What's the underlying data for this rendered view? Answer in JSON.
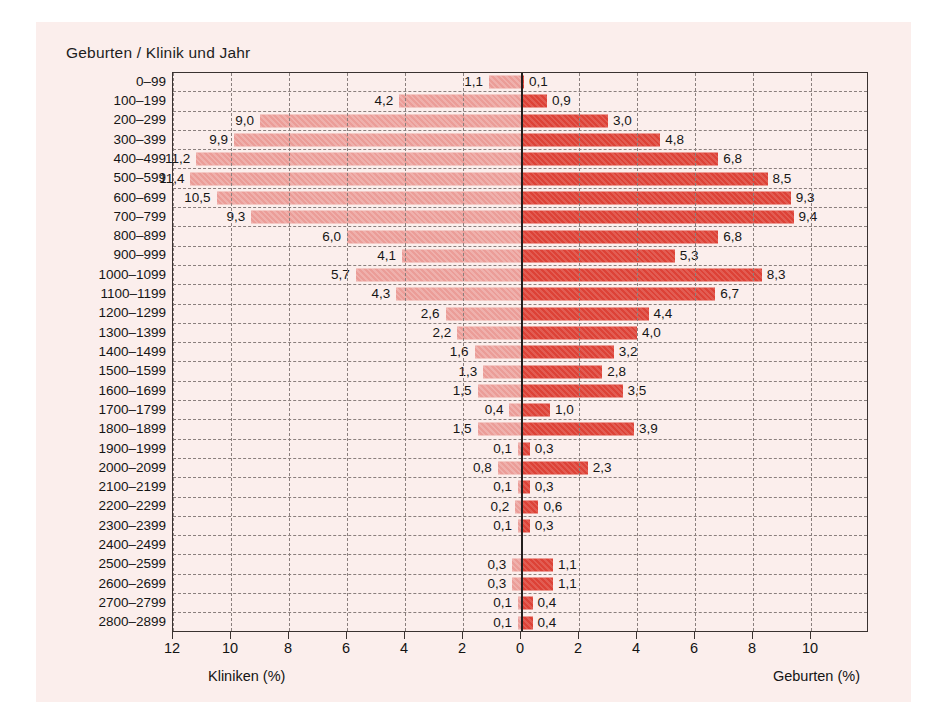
{
  "title": "Geburten / Klinik und Jahr",
  "axis": {
    "left_label": "Kliniken (%)",
    "right_label": "Geburten (%)",
    "left_ticks": [
      "12",
      "10",
      "8",
      "6",
      "4",
      "2",
      "0"
    ],
    "right_ticks": [
      "2",
      "4",
      "6",
      "8",
      "10"
    ],
    "left_max": 13.0,
    "right_max": 11.0
  },
  "colors": {
    "left_bar": "#eb9d98",
    "right_bar": "#dd4237",
    "panel_bg": "#fbeeec",
    "frame": "#3a3230",
    "grid": "#8a7f7d",
    "zero_line": "#231f1e"
  },
  "chart_data": {
    "type": "bar",
    "title": "Geburten / Klinik und Jahr",
    "orientation": "horizontal-diverging",
    "xlabel_left": "Kliniken (%)",
    "xlabel_right": "Geburten (%)",
    "ylabel": "",
    "xlim_left": [
      0,
      13
    ],
    "xlim_right": [
      0,
      11
    ],
    "grid": true,
    "legend": "none",
    "decimal_separator": ",",
    "categories": [
      "0–99",
      "100–199",
      "200–299",
      "300–399",
      "400–499",
      "500–599",
      "600–699",
      "700–799",
      "800–899",
      "900–999",
      "1000–1099",
      "1100–1199",
      "1200–1299",
      "1300–1399",
      "1400–1499",
      "1500–1599",
      "1600–1699",
      "1700–1799",
      "1800–1899",
      "1900–1999",
      "2000–2099",
      "2100–2199",
      "2200–2299",
      "2300–2399",
      "2400–2499",
      "2500–2599",
      "2600–2699",
      "2700–2799",
      "2800–2899"
    ],
    "series": [
      {
        "name": "Kliniken (%)",
        "side": "left",
        "color": "#eb9d98",
        "values": [
          1.1,
          4.2,
          9.0,
          9.9,
          11.2,
          11.4,
          10.5,
          9.3,
          6.0,
          4.1,
          5.7,
          4.3,
          2.6,
          2.2,
          1.6,
          1.3,
          1.5,
          0.4,
          1.5,
          0.1,
          0.8,
          0.1,
          0.2,
          0.1,
          null,
          0.3,
          0.3,
          0.1,
          0.1
        ],
        "labels": [
          "1,1",
          "4,2",
          "9,0",
          "9,9",
          "11,2",
          "11,4",
          "10,5",
          "9,3",
          "6,0",
          "4,1",
          "5,7",
          "4,3",
          "2,6",
          "2,2",
          "1,6",
          "1,3",
          "1,5",
          "0,4",
          "1,5",
          "0,1",
          "0,8",
          "0,1",
          "0,2",
          "0,1",
          "",
          "0,3",
          "0,3",
          "0,1",
          "0,1"
        ]
      },
      {
        "name": "Geburten (%)",
        "side": "right",
        "color": "#dd4237",
        "values": [
          0.1,
          0.9,
          3.0,
          4.8,
          6.8,
          8.5,
          9.3,
          9.4,
          6.8,
          5.3,
          8.3,
          6.7,
          4.4,
          4.0,
          3.2,
          2.8,
          3.5,
          1.0,
          3.9,
          0.3,
          2.3,
          0.3,
          0.6,
          0.3,
          null,
          1.1,
          1.1,
          0.4,
          0.4
        ],
        "labels": [
          "0,1",
          "0,9",
          "3,0",
          "4,8",
          "6,8",
          "8,5",
          "9,3",
          "9,4",
          "6,8",
          "5,3",
          "8,3",
          "6,7",
          "4,4",
          "4,0",
          "3,2",
          "2,8",
          "3,5",
          "1,0",
          "3,9",
          "0,3",
          "2,3",
          "0,3",
          "0,6",
          "0,3",
          "",
          "1,1",
          "1,1",
          "0,4",
          "0,4"
        ]
      }
    ]
  }
}
